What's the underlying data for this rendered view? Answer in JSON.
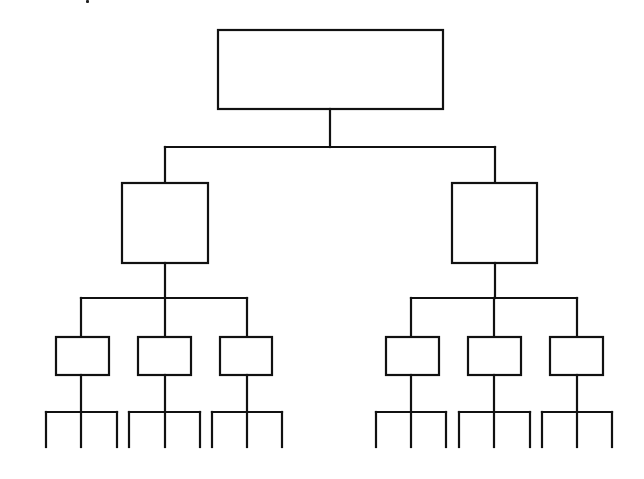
{
  "diagram": {
    "type": "hierarchy-tree",
    "labels_visible": false,
    "colors": {
      "line": "#111111",
      "fill": "#ffffff",
      "background": "#ffffff"
    },
    "root": {
      "id": "root",
      "box": [
        218,
        30,
        225,
        79
      ]
    },
    "level2": [
      {
        "id": "l2-left",
        "box": [
          122,
          183,
          86,
          80
        ]
      },
      {
        "id": "l2-right",
        "box": [
          452,
          183,
          85,
          80
        ]
      }
    ],
    "level3": [
      {
        "id": "l3-1",
        "parent": "l2-left",
        "box": [
          56,
          337,
          53,
          38
        ],
        "center_x": 81
      },
      {
        "id": "l3-2",
        "parent": "l2-left",
        "box": [
          138,
          337,
          53,
          38
        ],
        "center_x": 165
      },
      {
        "id": "l3-3",
        "parent": "l2-left",
        "box": [
          220,
          337,
          52,
          38
        ],
        "center_x": 247
      },
      {
        "id": "l3-4",
        "parent": "l2-right",
        "box": [
          386,
          337,
          53,
          38
        ],
        "center_x": 411
      },
      {
        "id": "l3-5",
        "parent": "l2-right",
        "box": [
          468,
          337,
          53,
          38
        ],
        "center_x": 494
      },
      {
        "id": "l3-6",
        "parent": "l2-right",
        "box": [
          550,
          337,
          53,
          38
        ],
        "center_x": 577
      }
    ],
    "leaf_stubs_per_node": 3
  }
}
